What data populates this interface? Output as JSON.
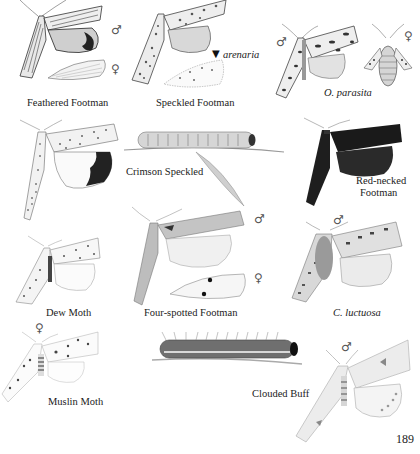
{
  "page": {
    "number": "189"
  },
  "symbols": {
    "male": "♂",
    "female": "♀",
    "pointer": "▼"
  },
  "species": [
    {
      "id": "feathered-footman",
      "label": "Feathered Footman",
      "italic": false,
      "sexes": [
        "male",
        "female"
      ]
    },
    {
      "id": "speckled-footman",
      "label": "Speckled Footman",
      "italic": false,
      "sublabel": "arenaria"
    },
    {
      "id": "o-parasita",
      "label": "O. parasita",
      "italic": true,
      "sexes": [
        "male",
        "female"
      ]
    },
    {
      "id": "crimson-speckled-adult",
      "label": "",
      "italic": false
    },
    {
      "id": "crimson-speckled-larva",
      "label": "Crimson Speckled",
      "italic": false
    },
    {
      "id": "red-necked-footman",
      "label": "Red-necked Footman",
      "label_lines": [
        "Red-necked",
        "Footman"
      ],
      "italic": false
    },
    {
      "id": "dew-moth",
      "label": "Dew Moth",
      "italic": false
    },
    {
      "id": "four-spotted-footman",
      "label": "Four-spotted Footman",
      "italic": false,
      "sexes": [
        "male",
        "female"
      ]
    },
    {
      "id": "c-luctuosa",
      "label": "C. luctuosa",
      "italic": true,
      "sexes": [
        "male"
      ]
    },
    {
      "id": "muslin-moth",
      "label": "Muslin Moth",
      "italic": false,
      "sexes": [
        "female"
      ]
    },
    {
      "id": "clouded-buff-larva",
      "label": "Clouded Buff",
      "italic": false
    },
    {
      "id": "clouded-buff-adult",
      "label": "",
      "italic": false,
      "sexes": [
        "male"
      ]
    }
  ],
  "colors": {
    "ink": "#222222",
    "pencil": "#6b6b6b",
    "dark_wing": "#1f1f1f",
    "paper": "#ffffff"
  }
}
